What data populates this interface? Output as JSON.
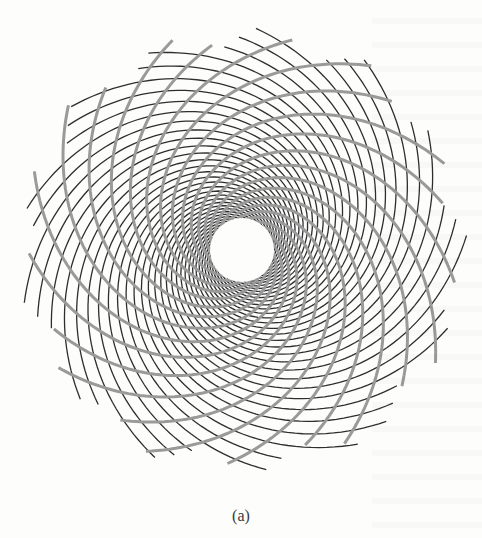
{
  "figure": {
    "caption": "(a)",
    "center": {
      "x": 242,
      "y": 250
    },
    "inner_radius": 30,
    "outer_radius": 226,
    "spiral_families": [
      {
        "name": "thin-dark-spirals",
        "count": 34,
        "direction": "counterclockwise",
        "color": "#2e2e2e",
        "stroke_width": 1.3,
        "twist": 2.6
      },
      {
        "name": "thick-gray-spirals",
        "count": 21,
        "direction": "clockwise",
        "color": "#9a9a9a",
        "stroke_width": 3.0,
        "twist": 1.9
      }
    ]
  },
  "colors": {
    "background": "#fdfdfc",
    "caption_text": "#3a3a3a"
  }
}
